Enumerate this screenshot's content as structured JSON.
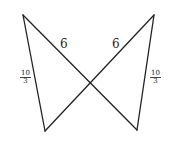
{
  "diagram": {
    "type": "bowtie-crossed-segments",
    "stroke_color": "#222222",
    "vertices": {
      "top_left": [
        23,
        15
      ],
      "top_right": [
        154,
        15
      ],
      "bottom_left": [
        45,
        131
      ],
      "bottom_right": [
        137,
        130
      ]
    },
    "segments": [
      {
        "from": "top_left",
        "to": "bottom_left",
        "label": "10/3"
      },
      {
        "from": "top_left",
        "to": "bottom_right",
        "label": "6"
      },
      {
        "from": "top_right",
        "to": "bottom_left",
        "label": "6"
      },
      {
        "from": "top_right",
        "to": "bottom_right",
        "label": "10/3"
      }
    ],
    "labels": {
      "left_diagonal": "6",
      "right_diagonal": "6",
      "left_side": {
        "numerator": "10",
        "denominator": "3"
      },
      "right_side": {
        "numerator": "10",
        "denominator": "3"
      }
    }
  }
}
